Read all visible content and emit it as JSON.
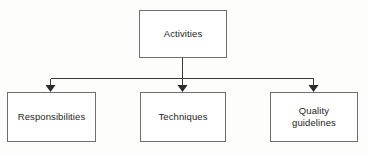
{
  "diagram": {
    "type": "hierarchy-tree",
    "orientation": "top-down",
    "background_color": "#fdfdfc",
    "line_color": "#3a3a3a",
    "box_border_color": "#6e6e6e",
    "box_fill_color": "#ffffff",
    "text_color": "#1d1d1b",
    "root": {
      "id": "activities",
      "label": "Activities"
    },
    "children": [
      {
        "id": "responsibilities",
        "label": "Responsibilities"
      },
      {
        "id": "techniques",
        "label": "Techniques"
      },
      {
        "id": "quality-guidelines",
        "label": "Quality\nguidelines"
      }
    ],
    "connectors": {
      "style": "orthogonal-bus",
      "arrowhead": "solid-triangle",
      "arrow_count": 3,
      "bus_y": 78,
      "stem_x": 182
    }
  }
}
